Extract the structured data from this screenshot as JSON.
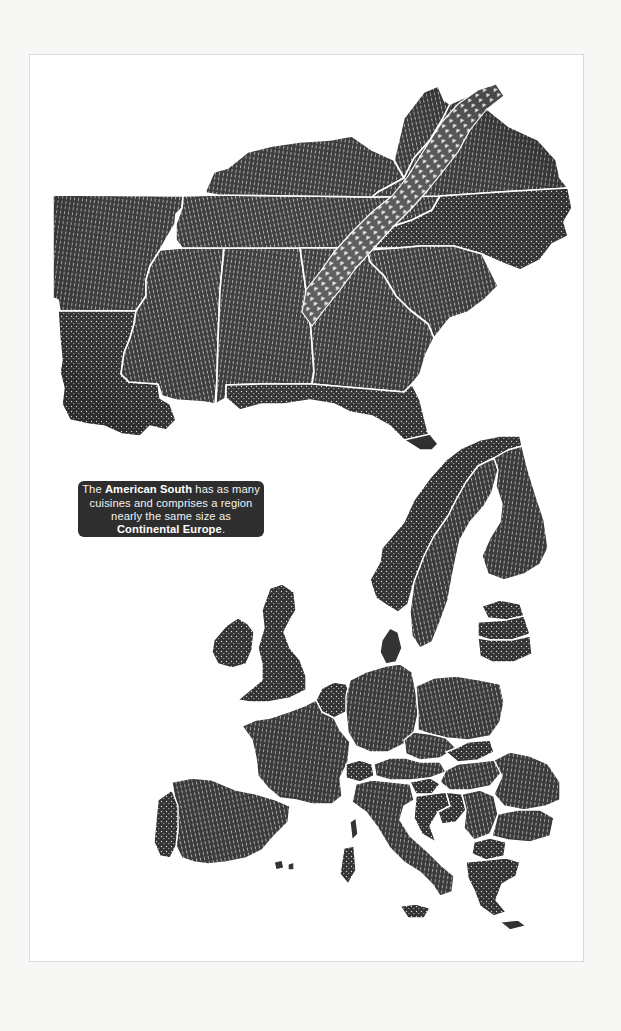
{
  "page": {
    "background": "#f7f7f6",
    "frame_color": "#ffffff",
    "ink_color": "#2e2e2e",
    "border_line_color": "#ffffff"
  },
  "callout": {
    "text_1": "The ",
    "bold_1": "American South",
    "text_2": " has as many cuisines and comprises a region nearly the same size as ",
    "bold_2": "Continental Europe",
    "text_3": "."
  },
  "maps": [
    {
      "name": "American South",
      "regions": [
        "Arkansas",
        "Louisiana",
        "Mississippi",
        "Alabama",
        "Tennessee",
        "Kentucky",
        "Georgia",
        "Florida",
        "South Carolina",
        "North Carolina",
        "Virginia",
        "West Virginia"
      ],
      "feature": "Appalachian Mountains"
    },
    {
      "name": "Continental Europe",
      "regions": [
        "Ireland",
        "United Kingdom",
        "Norway",
        "Sweden",
        "Finland",
        "Denmark",
        "Estonia",
        "Latvia",
        "Lithuania",
        "France",
        "Spain",
        "Portugal",
        "Germany",
        "Poland",
        "Czechia",
        "Slovakia",
        "Austria",
        "Switzerland",
        "Hungary",
        "Italy",
        "Slovenia",
        "Croatia",
        "Bosnia",
        "Serbia",
        "Romania",
        "Bulgaria",
        "Greece",
        "Netherlands",
        "Belgium",
        "Corsica",
        "Sardinia",
        "Sicily"
      ]
    }
  ]
}
